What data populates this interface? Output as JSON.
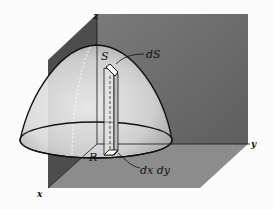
{
  "figure": {
    "type": "surface-area-diagram",
    "labels": {
      "surface": "S",
      "surface_element": "dS",
      "region": "R",
      "area_element": "dx dy",
      "x_axis": "x",
      "y_axis": "y",
      "z_axis": "z"
    },
    "colors": {
      "back_wall": "#6e6e6e",
      "side_wall": "#4a4a4a",
      "floor": "#8a8a8a",
      "surface_light": "#efefef",
      "line": "#111111",
      "background": "#fbfbfb"
    }
  }
}
